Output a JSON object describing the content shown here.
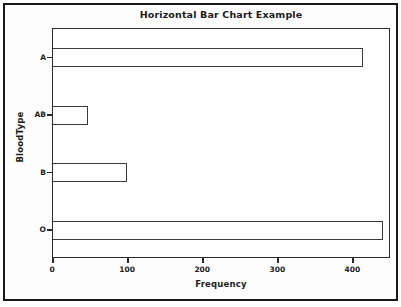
{
  "chart_data": {
    "type": "bar",
    "orientation": "horizontal",
    "title": "Horizontal Bar Chart Example",
    "xlabel": "Frequency",
    "ylabel": "BloodType",
    "categories": [
      "A",
      "AB",
      "B",
      "O"
    ],
    "values": [
      413,
      46,
      98,
      439
    ],
    "xlim": [
      0,
      450
    ],
    "xticks": [
      0,
      100,
      200,
      300,
      400
    ],
    "xtick_labels": [
      "0",
      "100",
      "200",
      "300",
      "400"
    ],
    "grid": false,
    "legend": null,
    "bar_fill_color": "#ffffff",
    "bar_edge_color": "#3a3a3a",
    "axis_color": "#2b2b2b",
    "text_color": "#1b1b1b",
    "background_color": "#ffffff"
  }
}
